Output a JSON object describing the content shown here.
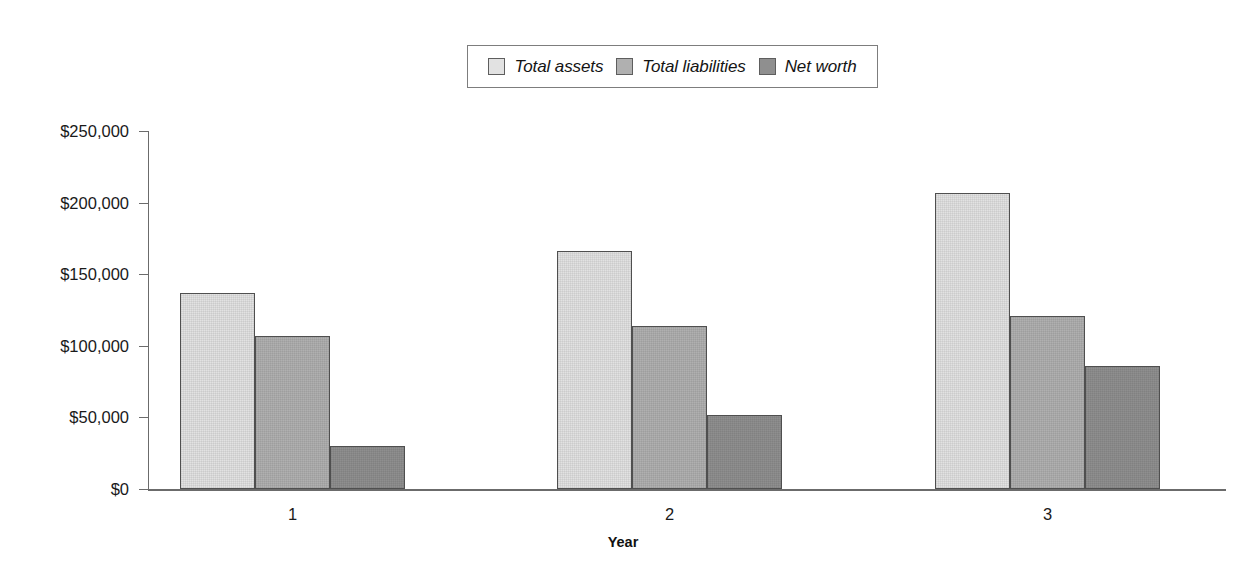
{
  "chart_data": {
    "type": "bar",
    "title": "",
    "xlabel": "Year",
    "ylabel": "",
    "categories": [
      "1",
      "2",
      "3"
    ],
    "series": [
      {
        "name": "Total assets",
        "color": "#e2e2e2",
        "values": [
          137000,
          166000,
          207000
        ]
      },
      {
        "name": "Total liabilities",
        "color": "#b0b0b0",
        "values": [
          107000,
          114000,
          121000
        ]
      },
      {
        "name": "Net worth",
        "color": "#8f8f8f",
        "values": [
          30000,
          52000,
          86000
        ]
      }
    ],
    "ylim": [
      0,
      250000
    ],
    "ytick_values": [
      0,
      50000,
      100000,
      150000,
      200000,
      250000
    ],
    "ytick_labels": [
      "$0",
      "$50,000",
      "$100,000",
      "$150,000",
      "$200,000",
      "$250,000"
    ],
    "grid": false,
    "legend_position": "top-center",
    "legend": [
      "Total assets",
      "Total liabilities",
      "Net worth"
    ]
  },
  "axis": {
    "x_title": "Year",
    "x_categories": [
      "1",
      "2",
      "3"
    ],
    "y_labels": [
      "$250,000",
      "$200,000",
      "$150,000",
      "$100,000",
      "$50,000",
      "$0"
    ]
  },
  "legend": {
    "items": [
      {
        "label": "Total assets",
        "swatch": "#e2e2e2"
      },
      {
        "label": "Total liabilities",
        "swatch": "#b0b0b0"
      },
      {
        "label": "Net worth",
        "swatch": "#8f8f8f"
      }
    ]
  }
}
